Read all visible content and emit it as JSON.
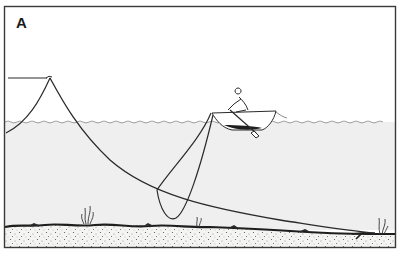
{
  "figure": {
    "panel_label": "A",
    "colors": {
      "frame": "#3a3a3a",
      "water": "#efefef",
      "sky": "#ffffff",
      "line": "#2a2a2a",
      "seabed": "#f4f4f2",
      "seabed_edge": "#1e1e1e"
    },
    "elements": [
      {
        "name": "buoy-line",
        "label": "Line to surface marker (left)"
      },
      {
        "name": "boat",
        "label": "Rowboat with rower"
      },
      {
        "name": "oar",
        "label": "Oar"
      },
      {
        "name": "rope-loop",
        "label": "Rope loop hanging from boat"
      },
      {
        "name": "long-anchor-line",
        "label": "Long line to anchor on seabed"
      },
      {
        "name": "anchor",
        "label": "Anchor at right on seabed"
      },
      {
        "name": "seaweed",
        "label": "Seaweed plants on seabed"
      }
    ]
  }
}
